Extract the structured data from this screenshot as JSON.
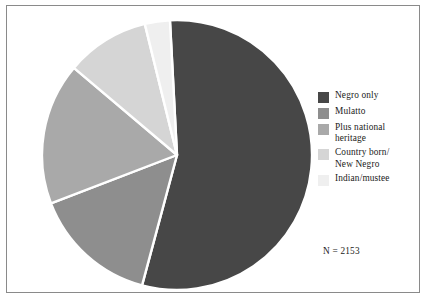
{
  "chart_data": {
    "type": "pie",
    "title": "",
    "subtitle": "",
    "xlabel": "",
    "ylabel": "",
    "legend_position": "right",
    "grid": false,
    "annotation": "N = 2153",
    "total": 2153,
    "start_angle_deg": -3,
    "direction": "clockwise",
    "categories": [
      "Negro only",
      "Mulatto",
      "Plus national heritage",
      "Country born/\nNew Negro",
      "Indian/mustee"
    ],
    "values": [
      55,
      15,
      17,
      10,
      3
    ],
    "colors": [
      "#474747",
      "#8e8e8e",
      "#a9a9a9",
      "#d5d5d5",
      "#efefef"
    ],
    "slices": [
      {
        "label": "Negro only",
        "value": 55,
        "color": "#474747"
      },
      {
        "label": "Mulatto",
        "value": 15,
        "color": "#8e8e8e"
      },
      {
        "label": "Plus national heritage",
        "value": 17,
        "color": "#a9a9a9"
      },
      {
        "label": "Country born/\nNew Negro",
        "value": 10,
        "color": "#d5d5d5"
      },
      {
        "label": "Indian/mustee",
        "value": 3,
        "color": "#efefef"
      }
    ]
  },
  "legend": {
    "items": [
      {
        "label": "Negro only",
        "color": "#474747"
      },
      {
        "label": "Mulatto",
        "color": "#8e8e8e"
      },
      {
        "label": "Plus national\nheritage",
        "color": "#a9a9a9"
      },
      {
        "label": "Country born/\nNew Negro",
        "color": "#d5d5d5"
      },
      {
        "label": "Indian/mustee",
        "color": "#efefef"
      }
    ]
  },
  "annotation": {
    "n_text": "N = 2153"
  },
  "style": {
    "frame_color": "#8a8a8a",
    "slice_separator_color": "#ffffff",
    "background": "#ffffff",
    "text_color": "#1a1a1a"
  }
}
